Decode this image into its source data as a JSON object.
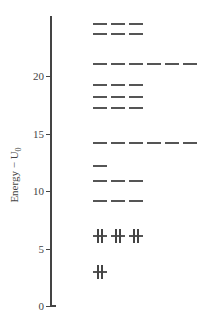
{
  "diagram": {
    "type": "energy-level-diagram",
    "ylabel": "Energy − U",
    "ylabel_sub": "0",
    "ylim": [
      0,
      25
    ],
    "ticks": [
      {
        "value": 0,
        "label": "0"
      },
      {
        "value": 5,
        "label": "5"
      },
      {
        "value": 10,
        "label": "10"
      },
      {
        "value": 15,
        "label": "15"
      },
      {
        "value": 20,
        "label": "20"
      }
    ],
    "levels": [
      {
        "energy": 3.0,
        "degeneracy": 1,
        "filled": true
      },
      {
        "energy": 6.1,
        "degeneracy": 3,
        "filled": true
      },
      {
        "energy": 9.2,
        "degeneracy": 3,
        "filled": false
      },
      {
        "energy": 11.0,
        "degeneracy": 3,
        "filled": false
      },
      {
        "energy": 12.3,
        "degeneracy": 1,
        "filled": false
      },
      {
        "energy": 14.3,
        "degeneracy": 6,
        "filled": false
      },
      {
        "energy": 17.3,
        "degeneracy": 3,
        "filled": false
      },
      {
        "energy": 18.3,
        "degeneracy": 3,
        "filled": false
      },
      {
        "energy": 19.3,
        "degeneracy": 3,
        "filled": false
      },
      {
        "energy": 21.1,
        "degeneracy": 6,
        "filled": false
      },
      {
        "energy": 23.7,
        "degeneracy": 3,
        "filled": false
      },
      {
        "energy": 24.6,
        "degeneracy": 3,
        "filled": false
      }
    ]
  }
}
